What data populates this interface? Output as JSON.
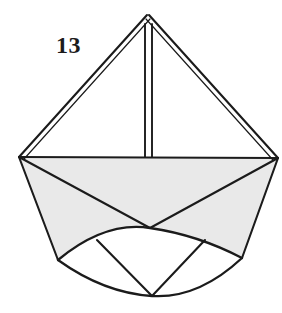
{
  "figure": {
    "label": "13",
    "caption_number": "13",
    "kind": "geometric-line-diagram",
    "background_color": "#ffffff",
    "stroke_color": "#1b1b1b",
    "fill_gray": "#e9e9e9",
    "fill_white": "#ffffff",
    "canvas": {
      "width": 282,
      "height": 313
    },
    "parts": [
      {
        "name": "upper-left-face",
        "fill": "#ffffff"
      },
      {
        "name": "upper-right-face",
        "fill": "#ffffff"
      },
      {
        "name": "center-crease",
        "fill": "none"
      },
      {
        "name": "body-left-face",
        "fill": "#e9e9e9"
      },
      {
        "name": "body-right-face",
        "fill": "#e9e9e9"
      },
      {
        "name": "body-lower-face",
        "fill": "#e9e9e9"
      },
      {
        "name": "lens-left-panel",
        "fill": "#ffffff"
      },
      {
        "name": "lens-center-panel",
        "fill": "#ffffff"
      },
      {
        "name": "lens-right-panel",
        "fill": "#ffffff"
      }
    ],
    "vertices": {
      "apex": {
        "x": 148,
        "y": 14
      },
      "left": {
        "x": 19,
        "y": 157
      },
      "right": {
        "x": 278,
        "y": 158
      },
      "center": {
        "x": 150,
        "y": 228
      },
      "bottom_left": {
        "x": 58,
        "y": 260
      },
      "bottom_right": {
        "x": 242,
        "y": 258
      },
      "bottom": {
        "x": 152,
        "y": 296
      }
    }
  }
}
